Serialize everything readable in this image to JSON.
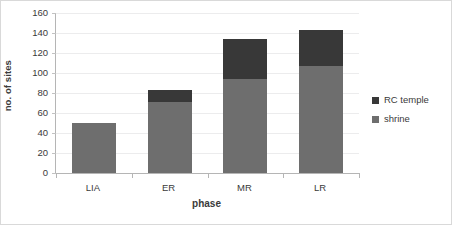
{
  "chart_data": {
    "type": "bar",
    "subtype": "stacked-vertical",
    "title": "",
    "xlabel": "phase",
    "ylabel": "no. of sites",
    "categories": [
      "LIA",
      "ER",
      "MR",
      "LR"
    ],
    "series": [
      {
        "name": "shrine",
        "color": "#6e6e6e",
        "values": [
          50,
          71,
          94,
          107
        ]
      },
      {
        "name": "RC temple",
        "color": "#383838",
        "values": [
          0,
          12,
          40,
          36
        ]
      }
    ],
    "totals": [
      50,
      83,
      134,
      143
    ],
    "ylim": [
      0,
      160
    ],
    "ytick_step": 20,
    "yticks": [
      160,
      140,
      120,
      100,
      80,
      60,
      40,
      20,
      0
    ],
    "grid": true,
    "grid_axis": "y",
    "legend_position": "right",
    "legend_entries": [
      {
        "label": "RC temple",
        "color": "#383838"
      },
      {
        "label": "shrine",
        "color": "#6e6e6e"
      }
    ]
  }
}
